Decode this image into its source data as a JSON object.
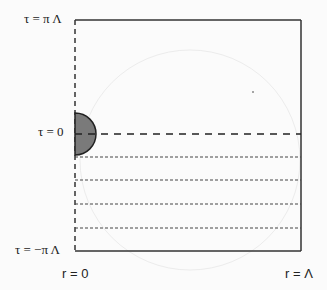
{
  "diagram": {
    "labels": {
      "tau_top": "τ = π Λ",
      "tau_zero": "τ = 0",
      "tau_bottom": "τ = −π Λ",
      "r_zero": "r = 0",
      "r_lambda": "r = Λ"
    },
    "colors": {
      "line": "#333333",
      "half_disk_fill": "#7a7a7a",
      "background": "#fbfbfb"
    },
    "elements": {
      "box": "rectangle with dashed left edge (r = 0) and solid top, right, bottom edges",
      "half_disk": "shaded semicircle at r = 0 centered on τ = 0",
      "tau_zero_line": "long-dashed horizontal line at τ = 0",
      "dotted_lines_count": 4
    }
  }
}
